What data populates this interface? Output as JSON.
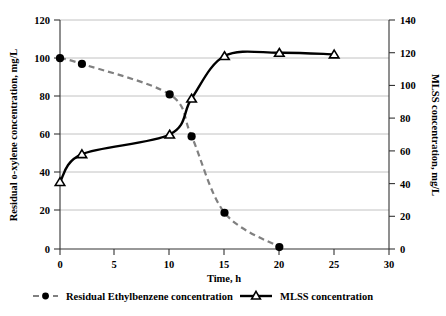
{
  "chart_data": {
    "type": "line",
    "title": "",
    "xlabel": "Time, h",
    "ylabel": "Residual o-xylene concentration, mg/L",
    "y2label": "MLSS concentration, mg/L",
    "xlim": [
      0,
      30
    ],
    "ylim": [
      0,
      120
    ],
    "y2lim": [
      0,
      140
    ],
    "xticks": [
      0,
      5,
      10,
      15,
      20,
      25,
      30
    ],
    "yticks": [
      0,
      20,
      40,
      60,
      80,
      100,
      120
    ],
    "y2ticks": [
      0,
      20,
      40,
      60,
      80,
      100,
      120,
      140
    ],
    "grid": true,
    "legend_position": "bottom",
    "series": [
      {
        "name": "Residual Ethylbenzene concentration",
        "axis": "left",
        "marker": "filled-circle",
        "line": "dashed",
        "color": "#808080",
        "marker_color": "#000000",
        "x": [
          0,
          2,
          10,
          12,
          15,
          20
        ],
        "values": [
          100,
          97,
          81,
          59,
          19,
          1
        ]
      },
      {
        "name": "MLSS concentration",
        "axis": "right",
        "marker": "open-triangle",
        "line": "solid",
        "color": "#000000",
        "marker_color": "#000000",
        "x": [
          0,
          2,
          10,
          12,
          15,
          20,
          25
        ],
        "values": [
          41,
          58,
          70,
          92,
          118,
          120,
          119
        ]
      }
    ]
  },
  "axes": {
    "left": {
      "title": "Residual o-xylene concentration, mg/L",
      "tick_labels": [
        "0",
        "20",
        "40",
        "60",
        "80",
        "100",
        "120"
      ]
    },
    "right": {
      "title": "MLSS concentration, mg/L",
      "tick_labels": [
        "0",
        "20",
        "40",
        "60",
        "80",
        "100",
        "120",
        "140"
      ]
    },
    "bottom": {
      "title": "Time, h",
      "tick_labels": [
        "0",
        "5",
        "10",
        "15",
        "20",
        "25",
        "30"
      ]
    }
  },
  "legend": {
    "items": [
      {
        "label": "Residual Ethylbenzene concentration",
        "marker": "filled-circle",
        "line": "dashed"
      },
      {
        "label": "MLSS concentration",
        "marker": "open-triangle",
        "line": "solid"
      }
    ]
  }
}
